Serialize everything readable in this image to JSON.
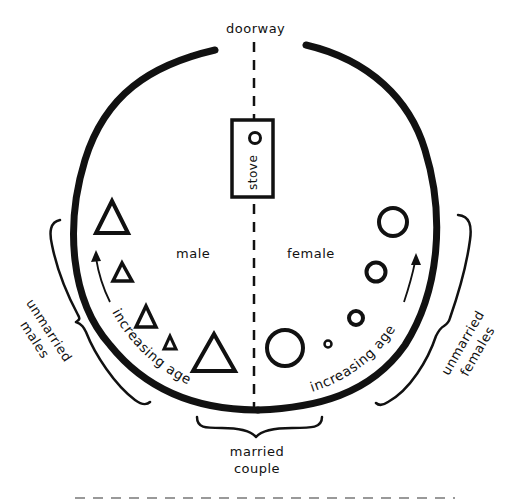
{
  "diagram": {
    "title_labels": {
      "doorway": "doorway",
      "stove": "stove",
      "male": "male",
      "female": "female",
      "married_couple_line1": "married",
      "married_couple_line2": "couple",
      "unmarried_males_line1": "unmarried",
      "unmarried_males_line2": "males",
      "unmarried_females_line1": "unmarried",
      "unmarried_females_line2": "females",
      "increasing_age_left": "increasing age",
      "increasing_age_right": "increasing age"
    },
    "legend_symbols": {
      "male_symbol": "triangle",
      "female_symbol": "circle",
      "stove_symbol": "circle-in-rectangle"
    },
    "male_side": {
      "label": "male",
      "members": [
        {
          "symbol": "triangle",
          "size": "large",
          "role": "married"
        },
        {
          "symbol": "triangle",
          "size": "tiny"
        },
        {
          "symbol": "triangle",
          "size": "small"
        },
        {
          "symbol": "triangle",
          "size": "small"
        },
        {
          "symbol": "triangle",
          "size": "medium"
        }
      ]
    },
    "female_side": {
      "label": "female",
      "members": [
        {
          "symbol": "circle",
          "size": "large",
          "role": "married"
        },
        {
          "symbol": "circle",
          "size": "tiny"
        },
        {
          "symbol": "circle",
          "size": "small"
        },
        {
          "symbol": "circle",
          "size": "medium-small"
        },
        {
          "symbol": "circle",
          "size": "medium"
        }
      ]
    },
    "colors": {
      "ink": "#111111",
      "background": "#ffffff"
    }
  }
}
